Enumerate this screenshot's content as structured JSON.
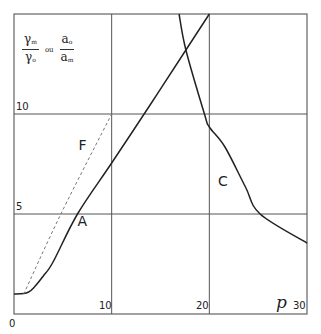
{
  "chart_data": {
    "type": "line",
    "title": "",
    "xlabel": "p",
    "ylabel": "γm/γo ou ao/am",
    "ylabel_parts": {
      "frac1_num": "γ",
      "frac1_num_sub": "m",
      "frac1_den": "γ",
      "frac1_den_sub": "o",
      "connector": "ou",
      "frac2_num": "a",
      "frac2_num_sub": "o",
      "frac2_den": "a",
      "frac2_den_sub": "m"
    },
    "xlim": [
      0,
      30
    ],
    "ylim": [
      0,
      15
    ],
    "grid": true,
    "x_ticks": [
      {
        "value": 0,
        "label": "0"
      },
      {
        "value": 10,
        "label": "10"
      },
      {
        "value": 20,
        "label": "20"
      },
      {
        "value": 30,
        "label": "30"
      }
    ],
    "y_ticks": [
      {
        "value": 5,
        "label": "5"
      },
      {
        "value": 10,
        "label": "10"
      }
    ],
    "series": [
      {
        "name": "A",
        "style": "solid",
        "x": [
          0,
          1,
          1.5,
          2,
          3,
          4,
          6.5,
          10,
          14,
          17.6,
          20
        ],
        "y": [
          1.0,
          1.02,
          1.1,
          1.3,
          1.9,
          2.6,
          5.0,
          7.55,
          10.5,
          13.2,
          15.0
        ]
      },
      {
        "name": "F",
        "style": "dashed",
        "x": [
          1,
          4.8,
          10
        ],
        "y": [
          1.0,
          5.0,
          10.0
        ]
      },
      {
        "name": "C",
        "style": "solid",
        "x": [
          16.9,
          17.6,
          19.5,
          20,
          21.6,
          23.7,
          25.2,
          30
        ],
        "y": [
          15.0,
          13.2,
          10.0,
          9.35,
          8.35,
          6.35,
          5.0,
          3.55
        ]
      }
    ],
    "annotations": [
      {
        "text": "A",
        "x": 6.5,
        "y": 4.4
      },
      {
        "text": "F",
        "x": 6.6,
        "y": 8.2
      },
      {
        "text": "C",
        "x": 20.9,
        "y": 6.4
      }
    ]
  }
}
